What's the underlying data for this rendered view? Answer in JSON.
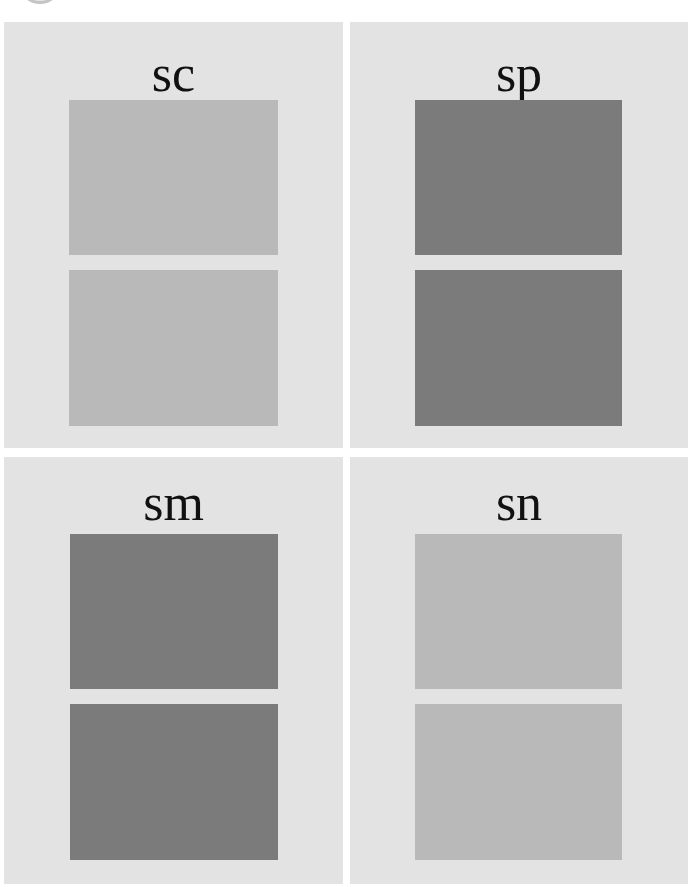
{
  "colors": {
    "page_bg": "#ffffff",
    "panel_bg": "#e3e3e3",
    "light_swatch": "#b9b9b9",
    "dark_swatch": "#7b7b7b",
    "label_text": "#111111"
  },
  "panels": [
    {
      "label": "sc",
      "swatch_tone": "light"
    },
    {
      "label": "sp",
      "swatch_tone": "dark"
    },
    {
      "label": "sm",
      "swatch_tone": "dark"
    },
    {
      "label": "sn",
      "swatch_tone": "light"
    }
  ]
}
